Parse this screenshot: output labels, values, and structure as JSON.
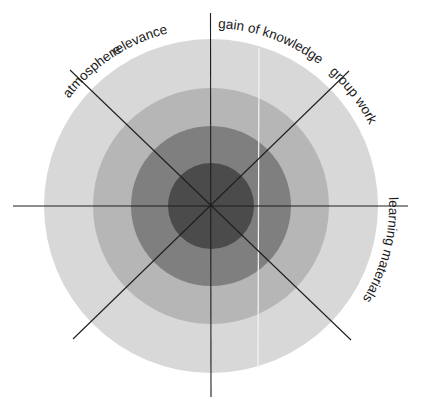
{
  "diagram": {
    "type": "concentric-sector-target",
    "center": [
      211,
      206
    ],
    "rings": [
      {
        "name": "outer",
        "radius": 167,
        "color": "#d8d8d8"
      },
      {
        "name": "second",
        "radius": 118,
        "color": "#b6b6b6"
      },
      {
        "name": "third",
        "radius": 80,
        "color": "#7f7f7f"
      },
      {
        "name": "inner",
        "radius": 43,
        "color": "#4b4b4b"
      }
    ],
    "line_color": "#1e1e1e",
    "highlight_line_color": "#f4f4f4",
    "labels": {
      "relevance": "relevance",
      "gain_of_knowledge": "gain of knowledge",
      "group_work": "group work",
      "learning_materials": "learning materials",
      "applyability": "applyability",
      "lecture": "lecture",
      "organisation": "organisation",
      "atmosphere": "atmosphere"
    }
  }
}
